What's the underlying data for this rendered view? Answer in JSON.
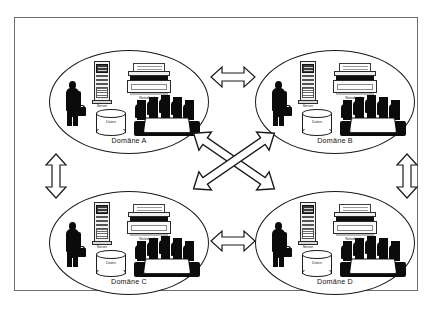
{
  "diagram": {
    "border_color": "#6e6e6e",
    "background": "#ffffff",
    "ink_color": "#0b0b0b",
    "domains": [
      {
        "id": "a",
        "label": "Domäne A",
        "server_label": "Server",
        "printer_label": "Netzdrucker",
        "database_label": "Daten",
        "person_name": "businessman-icon",
        "meeting_name": "meeting-group-icon"
      },
      {
        "id": "b",
        "label": "Domäne B",
        "server_label": "Server",
        "printer_label": "Netzdrucker",
        "database_label": "Daten",
        "person_name": "businessman-icon",
        "meeting_name": "meeting-group-icon"
      },
      {
        "id": "c",
        "label": "Domäne C",
        "server_label": "Server",
        "printer_label": "Netzdrucker",
        "database_label": "Daten",
        "person_name": "businessman-icon",
        "meeting_name": "meeting-group-icon"
      },
      {
        "id": "d",
        "label": "Domäne D",
        "server_label": "Server",
        "printer_label": "Netzdrucker",
        "database_label": "Daten",
        "person_name": "businessman-icon",
        "meeting_name": "meeting-group-icon"
      }
    ],
    "connections": [
      {
        "id": "ab",
        "from": "Domäne A",
        "to": "Domäne B",
        "orientation": "horizontal",
        "style": "double-headed-hollow"
      },
      {
        "id": "cd",
        "from": "Domäne C",
        "to": "Domäne D",
        "orientation": "horizontal",
        "style": "double-headed-hollow"
      },
      {
        "id": "ac",
        "from": "Domäne A",
        "to": "Domäne C",
        "orientation": "vertical",
        "style": "double-headed-hollow"
      },
      {
        "id": "bd",
        "from": "Domäne B",
        "to": "Domäne D",
        "orientation": "vertical",
        "style": "double-headed-hollow"
      },
      {
        "id": "ad",
        "from": "Domäne A",
        "to": "Domäne D",
        "orientation": "diagonal-down-right",
        "style": "double-headed-hollow"
      },
      {
        "id": "bc",
        "from": "Domäne B",
        "to": "Domäne C",
        "orientation": "diagonal-down-left",
        "style": "double-headed-hollow"
      }
    ]
  }
}
